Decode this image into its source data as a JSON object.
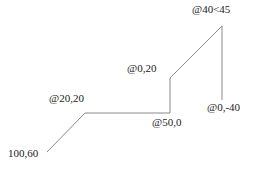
{
  "figure": {
    "width": 257,
    "height": 172,
    "background_color": "#ffffff",
    "line_color": "#8a8a8a",
    "line_width": 1,
    "text_color": "#1a1a1a"
  },
  "labels": [
    {
      "id": "start-point",
      "text": "100,60",
      "x": 8,
      "y": 148,
      "name": "label-start-point"
    },
    {
      "id": "segment-1",
      "text": "@20,20",
      "x": 49,
      "y": 93,
      "name": "label-segment-at-20-20"
    },
    {
      "id": "segment-2",
      "text": "@50,0",
      "x": 152,
      "y": 117,
      "name": "label-segment-at-50-0"
    },
    {
      "id": "segment-3",
      "text": "@0,20",
      "x": 127,
      "y": 63,
      "name": "label-segment-at-0-20"
    },
    {
      "id": "segment-4",
      "text": "@40<45",
      "x": 192,
      "y": 4,
      "name": "label-segment-at-40-angle-45"
    },
    {
      "id": "segment-5",
      "text": "@0,-40",
      "x": 207,
      "y": 102,
      "name": "label-segment-at-0-minus-40"
    }
  ],
  "chart_data": {
    "type": "line",
    "xlabel": "",
    "ylabel": "",
    "vertices": [
      {
        "name": "start",
        "entry": "100,60",
        "px": 47,
        "py": 152
      },
      {
        "name": "v1",
        "entry": "@20,20",
        "px": 85,
        "py": 113
      },
      {
        "name": "v2",
        "entry": "@50,0",
        "px": 170,
        "py": 113
      },
      {
        "name": "v3",
        "entry": "@0,20",
        "px": 170,
        "py": 78
      },
      {
        "name": "v4",
        "entry": "@40<45",
        "px": 222,
        "py": 26
      },
      {
        "name": "v5",
        "entry": "@0,-40",
        "px": 222,
        "py": 100
      }
    ],
    "segments": [
      {
        "from": "start",
        "to": "v1",
        "entry": "@20,20"
      },
      {
        "from": "v1",
        "to": "v2",
        "entry": "@50,0"
      },
      {
        "from": "v2",
        "to": "v3",
        "entry": "@0,20"
      },
      {
        "from": "v3",
        "to": "v4",
        "entry": "@40<45"
      },
      {
        "from": "v4",
        "to": "v5",
        "entry": "@0,-40"
      }
    ],
    "grid": false,
    "legend": false
  }
}
